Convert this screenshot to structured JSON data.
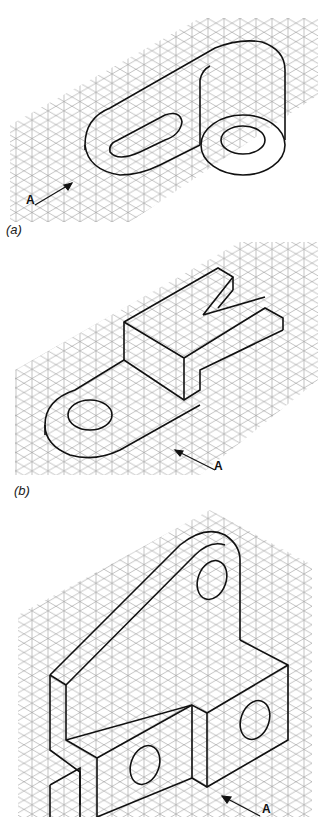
{
  "figure": {
    "type": "isometric-sketch-exercises",
    "panels": [
      {
        "id": "a",
        "caption": "(a)",
        "view_arrow_label": "A"
      },
      {
        "id": "b",
        "caption": "(b)",
        "view_arrow_label": "A"
      },
      {
        "id": "c",
        "caption": "",
        "view_arrow_label": "A"
      }
    ],
    "colors": {
      "grid": "#9a9a9a",
      "outline": "#111111",
      "background": "#ffffff"
    }
  }
}
